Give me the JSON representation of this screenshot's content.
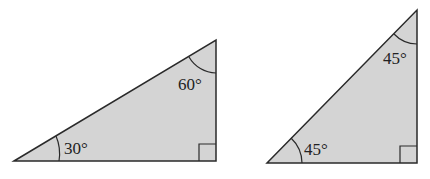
{
  "triangles": [
    {
      "name": "30-60-90 triangle",
      "angles": {
        "bottom_left": "30°",
        "top_right": "60°",
        "right_angle": "90°"
      },
      "fill": "#d4d4d4",
      "stroke": "#2a2a2a"
    },
    {
      "name": "45-45-90 triangle",
      "angles": {
        "bottom_left": "45°",
        "top_right": "45°",
        "right_angle": "90°"
      },
      "fill": "#d4d4d4",
      "stroke": "#2a2a2a"
    }
  ]
}
